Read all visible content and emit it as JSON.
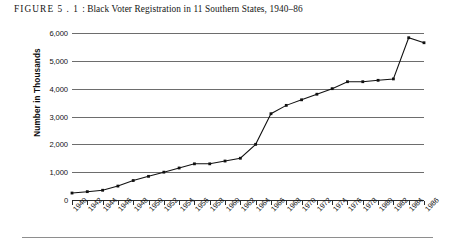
{
  "caption": {
    "figure_label": "FIGURE",
    "figure_number": "5 . 1",
    "separator": ":",
    "title": "Black Voter Registration in 11 Southern States, 1940–86",
    "full_text": "FIGURE 5.1 : Black Voter Registration in 11 Southern States, 1940–86"
  },
  "chart_data": {
    "type": "line",
    "title": "Black Voter Registration in 11 Southern States, 1940–86",
    "xlabel": "",
    "ylabel": "Number in Thousands",
    "ylim": [
      0,
      6000
    ],
    "ytick_labels": [
      "0",
      "1,000",
      "2,000",
      "3,000",
      "4,000",
      "5,000",
      "6,000"
    ],
    "ytick_values": [
      0,
      1000,
      2000,
      3000,
      4000,
      5000,
      6000
    ],
    "grid": true,
    "grid_axis": "y",
    "legend": false,
    "marker": "filled-square",
    "categories": [
      "1940",
      "1942",
      "1944",
      "1946",
      "1948",
      "1950",
      "1952",
      "1954",
      "1956",
      "1958",
      "1960",
      "1962",
      "1964",
      "1966",
      "1968",
      "1970",
      "1972",
      "1974",
      "1976",
      "1978",
      "1980",
      "1982",
      "1984",
      "1986"
    ],
    "values": [
      250,
      300,
      350,
      500,
      700,
      850,
      1000,
      1150,
      1300,
      1300,
      1400,
      1500,
      2000,
      3100,
      3400,
      3600,
      3800,
      4000,
      4250,
      4250,
      4300,
      4350,
      5830,
      5650
    ],
    "series": [
      {
        "name": "Black voter registration",
        "values": [
          250,
          300,
          350,
          500,
          700,
          850,
          1000,
          1150,
          1300,
          1300,
          1400,
          1500,
          2000,
          3100,
          3400,
          3600,
          3800,
          4000,
          4250,
          4250,
          4300,
          4350,
          5830,
          5650
        ]
      }
    ],
    "colors": {
      "line": "#111111",
      "marker": "#111111",
      "grid": "#6d6d6d",
      "axis": "#2b2b2b",
      "background": "#ffffff"
    }
  }
}
